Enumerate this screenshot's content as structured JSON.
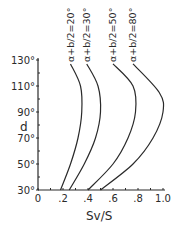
{
  "chart_data": {
    "type": "line",
    "title": "",
    "xlabel": "Sv/S",
    "ylabel": "d",
    "xlim": [
      0,
      1.0
    ],
    "ylim": [
      30,
      130
    ],
    "grid": false,
    "legend_position": "inline labels above curve tops (rotated)",
    "x_ticks": [
      "0",
      ".2",
      ".4",
      ".6",
      ".8",
      "1.0"
    ],
    "y_ticks": [
      "30°",
      "50°",
      "70°",
      "90°",
      "110°",
      "130°"
    ],
    "series": [
      {
        "name": "α+b/2=20°",
        "points": [
          [
            0.18,
            30
          ],
          [
            0.26,
            50
          ],
          [
            0.32,
            70
          ],
          [
            0.35,
            90
          ],
          [
            0.34,
            110
          ],
          [
            0.26,
            127
          ]
        ]
      },
      {
        "name": "α+b/2=30°",
        "points": [
          [
            0.25,
            30
          ],
          [
            0.37,
            50
          ],
          [
            0.46,
            70
          ],
          [
            0.5,
            90
          ],
          [
            0.48,
            110
          ],
          [
            0.39,
            127
          ]
        ]
      },
      {
        "name": "α+b/2=50°",
        "points": [
          [
            0.4,
            30
          ],
          [
            0.6,
            50
          ],
          [
            0.72,
            70
          ],
          [
            0.78,
            90
          ],
          [
            0.76,
            110
          ],
          [
            0.6,
            127
          ]
        ]
      },
      {
        "name": "α+b/2=80°",
        "points": [
          [
            0.5,
            30
          ],
          [
            0.76,
            50
          ],
          [
            0.92,
            70
          ],
          [
            1.0,
            90
          ],
          [
            0.97,
            105
          ],
          [
            0.76,
            127
          ]
        ]
      }
    ]
  }
}
